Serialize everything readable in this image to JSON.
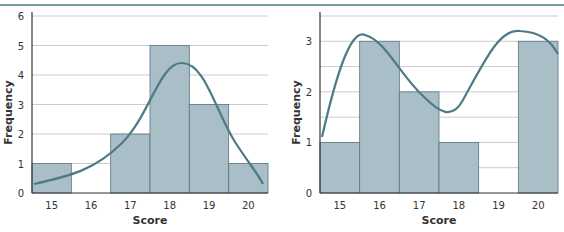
{
  "figure": {
    "caption": "Figure ... Histogram of ..."
  },
  "colors": {
    "bar": "#a9bec6",
    "bar_stroke": "#5a7682",
    "curve": "#4e7a86",
    "grid": "#cccccc",
    "axis": "#333333",
    "rule": "#7a9aa6"
  },
  "chart_data": [
    {
      "type": "bar",
      "title": "",
      "xlabel": "Score",
      "ylabel": "Frequency",
      "categories": [
        "15",
        "16",
        "17",
        "18",
        "19",
        "20"
      ],
      "values": [
        1,
        0,
        2,
        5,
        3,
        1
      ],
      "ylim": [
        0,
        6
      ],
      "yticks": [
        0,
        1,
        2,
        3,
        4,
        5,
        6
      ],
      "grid": true,
      "overlay": "smooth unimodal density curve peaking near 17.8 at ~5.4"
    },
    {
      "type": "bar",
      "title": "",
      "xlabel": "Score",
      "ylabel": "Frequency",
      "categories": [
        "15",
        "16",
        "17",
        "18",
        "19",
        "20"
      ],
      "values": [
        1,
        3,
        2,
        1,
        0,
        3
      ],
      "ylim": [
        0,
        3.5
      ],
      "yticks": [
        0,
        1,
        2,
        3
      ],
      "grid": true,
      "grid_step": 0.5,
      "overlay": "smooth bimodal curve with peaks near 16 (~3.15) and 20 (~3.2), trough near 18 (~1.55)"
    }
  ]
}
